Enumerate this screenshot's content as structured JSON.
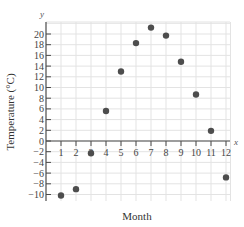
{
  "chart_data": {
    "type": "scatter",
    "title": "",
    "xlabel": "Month",
    "ylabel": "Temperature (°C)",
    "x_axis_var": "x",
    "y_axis_var": "y",
    "xlim": [
      0,
      12
    ],
    "ylim": [
      -12,
      22
    ],
    "x_ticks": [
      1,
      2,
      3,
      4,
      5,
      6,
      7,
      8,
      9,
      10,
      11,
      12
    ],
    "y_ticks": [
      -10,
      -8,
      -6,
      -4,
      -2,
      0,
      2,
      4,
      6,
      8,
      10,
      12,
      14,
      16,
      18,
      20
    ],
    "grid": true,
    "legend": null,
    "series": [
      {
        "name": "Average monthly temperature",
        "x": [
          1,
          2,
          3,
          4,
          5,
          6,
          7,
          8,
          9,
          10,
          11,
          12
        ],
        "values": [
          -10.2,
          -9,
          -2.3,
          5.6,
          13,
          18.3,
          21.2,
          19.7,
          14.8,
          8.7,
          1.9,
          -6.8
        ]
      }
    ]
  },
  "colors": {
    "point": "#4d4d4d",
    "axis": "#4a4a4a",
    "grid": "#e3e3e3",
    "background": "#ffffff"
  }
}
